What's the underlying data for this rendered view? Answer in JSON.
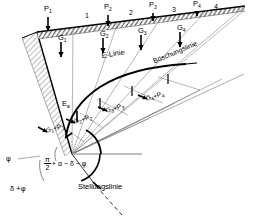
{
  "figure": {
    "width": 257,
    "height": 219,
    "background": "#ffffff",
    "line_color": "#000000",
    "thin_line_color": "#555555",
    "hatch_color": "#666666",
    "guide_color": "#9a9a9a"
  },
  "loads": [
    {
      "id": "P1",
      "base": "P",
      "sub": "1",
      "x": 47,
      "y": 9
    },
    {
      "id": "P2",
      "base": "P",
      "sub": "2",
      "x": 107,
      "y": 8
    },
    {
      "id": "P3",
      "base": "P",
      "sub": "3",
      "x": 152,
      "y": 6
    },
    {
      "id": "P4",
      "base": "P",
      "sub": "4",
      "x": 196,
      "y": 4
    }
  ],
  "wedge_numbers": [
    {
      "label": "1",
      "x": 87,
      "y": 17
    },
    {
      "label": "2",
      "x": 131,
      "y": 14
    },
    {
      "label": "3",
      "x": 173,
      "y": 11
    },
    {
      "label": "4",
      "x": 214,
      "y": 8
    }
  ],
  "weights": [
    {
      "id": "G1",
      "base": "G",
      "sub": "1",
      "x": 61,
      "y": 34
    },
    {
      "id": "G2",
      "base": "G",
      "sub": "2",
      "x": 104,
      "y": 31
    },
    {
      "id": "G3",
      "base": "G",
      "sub": "3",
      "x": 142,
      "y": 28
    },
    {
      "id": "G4",
      "base": "G",
      "sub": "4",
      "x": 181,
      "y": 25
    }
  ],
  "polygon_labels": [
    {
      "id": "G1P1",
      "base": "G",
      "sub": "1",
      "plus": "+P",
      "sub2": "1",
      "x": 48,
      "y": 130
    },
    {
      "id": "G2P2",
      "base": "G",
      "sub": "2",
      "plus": "+P",
      "sub2": "2",
      "x": 75,
      "y": 122
    },
    {
      "id": "G3P3",
      "base": "G",
      "sub": "3",
      "plus": "+P",
      "sub2": "3",
      "x": 108,
      "y": 111
    },
    {
      "id": "G4P4",
      "base": "G",
      "sub": "4",
      "plus": "+P",
      "sub2": "4",
      "x": 148,
      "y": 99
    }
  ],
  "curve_labels": {
    "e_linie": {
      "text": "E-Linie",
      "x": 105,
      "y": 57
    },
    "boeschungslinie": {
      "text": "Böschungslinie",
      "x": 163,
      "y": 60
    },
    "ea": {
      "base": "E",
      "sub": "a",
      "x": 66,
      "y": 102
    }
  },
  "angles": {
    "phi": {
      "text": "φ",
      "x": 8,
      "y": 159
    },
    "delta_plus_phi": {
      "text": "δ +φ",
      "x": 12,
      "y": 189
    },
    "formula": {
      "numerator": "π",
      "denominator": "2",
      "rest": "+ α − δ − φ"
    },
    "formula_x": 44,
    "formula_y": 158
  },
  "annotations": {
    "stellungslinie": {
      "text": "Stellungslinie",
      "x": 80,
      "y": 186
    }
  }
}
